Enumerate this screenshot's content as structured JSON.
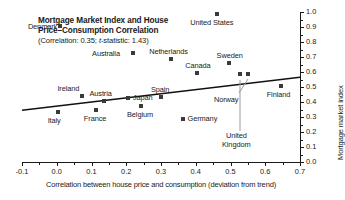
{
  "title": {
    "line1": "Mortgage Market Index and House",
    "line2": "Price–Consumption Correlation",
    "subtitle_pre": "(Correlation: 0.35; ",
    "subtitle_italic": "t",
    "subtitle_post": "-statistic: 1.43)"
  },
  "chart_data": {
    "type": "scatter",
    "title": "Mortgage Market Index and House Price–Consumption Correlation",
    "subtitle": "(Correlation: 0.35; t-statistic: 1.43)",
    "xlabel": "Correlation between house price and consumption (deviation from trend)",
    "ylabel": "Mortgage market index",
    "xlim": [
      -0.1,
      0.7
    ],
    "ylim": [
      0.0,
      1.0
    ],
    "xticks": [
      -0.1,
      0.0,
      0.1,
      0.2,
      0.3,
      0.4,
      0.5,
      0.6,
      0.7
    ],
    "xticklabels": [
      "-0.1",
      "0.0",
      "0.1",
      "0.2",
      "0.3",
      "0.4",
      "0.5",
      "0.6",
      "0.7"
    ],
    "yticks": [
      0.0,
      0.1,
      0.2,
      0.3,
      0.4,
      0.5,
      0.6,
      0.7,
      0.8,
      0.9,
      1.0
    ],
    "yticklabels": [
      "0.0",
      "0.1",
      "0.2",
      "0.3",
      "0.4",
      "0.5",
      "0.6",
      "0.7",
      "0.8",
      "0.9",
      "1.0"
    ],
    "grid": false,
    "legend": false,
    "yaxis_side": "right",
    "correlation": 0.35,
    "t_statistic": 1.43,
    "trendline": {
      "x": [
        -0.1,
        0.7
      ],
      "y": [
        0.345,
        0.565
      ]
    },
    "points": [
      {
        "label": "Denmark",
        "x": 0.01,
        "y": 0.905,
        "label_pos": "left"
      },
      {
        "label": "United States",
        "x": 0.46,
        "y": 0.99,
        "label_pos": "below"
      },
      {
        "label": "Netherlands",
        "x": 0.33,
        "y": 0.69,
        "label_pos": "above"
      },
      {
        "label": "Australia",
        "x": 0.218,
        "y": 0.725,
        "label_pos": "left"
      },
      {
        "label": "Sweden",
        "x": 0.495,
        "y": 0.66,
        "label_pos": "above"
      },
      {
        "label": "Canada",
        "x": 0.405,
        "y": 0.595,
        "label_pos": "above"
      },
      {
        "label": "Norway",
        "x": 0.55,
        "y": 0.585,
        "label_pos": "leader-down-left"
      },
      {
        "label": "Finland",
        "x": 0.645,
        "y": 0.51,
        "label_pos": "below"
      },
      {
        "label": "United Kingdom",
        "x": 0.528,
        "y": 0.585,
        "label_pos": "leader-down"
      },
      {
        "label": "Spain",
        "x": 0.3,
        "y": 0.435,
        "label_pos": "above"
      },
      {
        "label": "Japan",
        "x": 0.205,
        "y": 0.43,
        "label_pos": "right"
      },
      {
        "label": "Austria",
        "x": 0.135,
        "y": 0.405,
        "label_pos": "above"
      },
      {
        "label": "Belgium",
        "x": 0.243,
        "y": 0.375,
        "label_pos": "below"
      },
      {
        "label": "Ireland",
        "x": 0.072,
        "y": 0.44,
        "label_pos": "below-left"
      },
      {
        "label": "France",
        "x": 0.113,
        "y": 0.345,
        "label_pos": "below"
      },
      {
        "label": "Italy",
        "x": 0.003,
        "y": 0.335,
        "label_pos": "below"
      },
      {
        "label": "Germany",
        "x": 0.362,
        "y": 0.29,
        "label_pos": "right"
      }
    ]
  }
}
